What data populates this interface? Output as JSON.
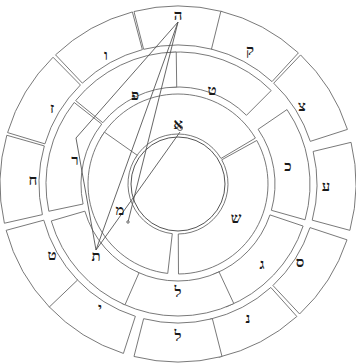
{
  "diagram": {
    "type": "letter-wheel",
    "center": [
      178,
      184
    ],
    "colors": {
      "stroke": "#6a6a6a",
      "letter": "#1a1a1a",
      "background": "#ffffff"
    },
    "rings": {
      "outer": {
        "radius_inner": 136,
        "radius_outer": 182,
        "cells": [
          {
            "letter": "ה",
            "x": 178,
            "y": 15
          },
          {
            "letter": "ק",
            "x": 250,
            "y": 50
          },
          {
            "letter": "צ",
            "x": 302,
            "y": 106
          },
          {
            "letter": "ע",
            "x": 326,
            "y": 186
          },
          {
            "letter": "ס",
            "x": 300,
            "y": 262
          },
          {
            "letter": "נ",
            "x": 248,
            "y": 318
          },
          {
            "letter": "ל",
            "x": 178,
            "y": 336
          },
          {
            "letter": "י",
            "x": 100,
            "y": 308
          },
          {
            "letter": "ט",
            "x": 52,
            "y": 255
          },
          {
            "letter": "ח",
            "x": 33,
            "y": 180
          },
          {
            "letter": "ז",
            "x": 52,
            "y": 108
          },
          {
            "letter": "ו",
            "x": 106,
            "y": 55
          }
        ]
      },
      "middle": {
        "radius_inner": 94,
        "radius_outer": 136,
        "cells": [
          {
            "letter": "ט",
            "x": 212,
            "y": 90
          },
          {
            "letter": "כ",
            "x": 288,
            "y": 166
          },
          {
            "letter": "ג",
            "x": 262,
            "y": 264
          },
          {
            "letter": "ל",
            "x": 178,
            "y": 292
          },
          {
            "letter": "ת",
            "x": 96,
            "y": 256
          },
          {
            "letter": "ר",
            "x": 75,
            "y": 160
          },
          {
            "letter": "פ",
            "x": 135,
            "y": 95
          }
        ]
      },
      "inner": {
        "radius_inner": 47,
        "radius_outer": 94,
        "cells": [
          {
            "letter": "א",
            "x": 178,
            "y": 124
          },
          {
            "letter": "ש",
            "x": 236,
            "y": 218
          },
          {
            "letter": "מ",
            "x": 120,
            "y": 210
          }
        ]
      }
    },
    "core": {
      "radius": 47
    },
    "links": [
      {
        "from": [
          178,
          22
        ],
        "to": [
          76,
          138
        ]
      },
      {
        "from": [
          178,
          22
        ],
        "to": [
          128,
          222
        ]
      },
      {
        "from": [
          178,
          22
        ],
        "to": [
          96,
          250
        ]
      },
      {
        "from": [
          180,
          132
        ],
        "to": [
          96,
          250
        ]
      },
      {
        "from": [
          76,
          138
        ],
        "to": [
          96,
          250
        ]
      }
    ],
    "nodes": [
      {
        "x": 180,
        "y": 128,
        "r": 2.5
      },
      {
        "x": 128,
        "y": 222,
        "r": 1.2
      }
    ]
  }
}
